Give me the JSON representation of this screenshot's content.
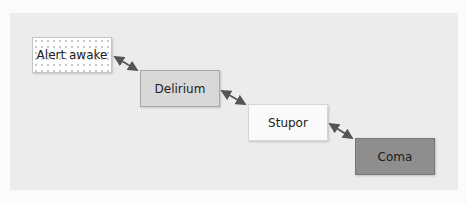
{
  "diagram": {
    "type": "state-progression",
    "nodes": [
      {
        "id": "alert",
        "label": "Alert awake",
        "fill": "#ffffff",
        "pattern": "dots",
        "x": 32,
        "y": 37,
        "w": 80,
        "h": 36
      },
      {
        "id": "delirium",
        "label": "Delirium",
        "fill": "#d8d8d8",
        "x": 140,
        "y": 70,
        "w": 80,
        "h": 37
      },
      {
        "id": "stupor",
        "label": "Stupor",
        "fill": "#fafafa",
        "x": 248,
        "y": 104,
        "w": 80,
        "h": 37
      },
      {
        "id": "coma",
        "label": "Coma",
        "fill": "#8e8e8e",
        "x": 355,
        "y": 138,
        "w": 80,
        "h": 37
      }
    ],
    "edges": [
      {
        "from": "alert",
        "to": "delirium",
        "bidirectional": true
      },
      {
        "from": "delirium",
        "to": "stupor",
        "bidirectional": true
      },
      {
        "from": "stupor",
        "to": "coma",
        "bidirectional": true
      }
    ],
    "colors": {
      "panel_background": "#ececec",
      "arrow": "#555555"
    }
  }
}
